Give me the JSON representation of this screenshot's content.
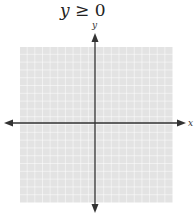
{
  "title": {
    "lhs": "y",
    "op": "≥",
    "rhs": "0"
  },
  "axes": {
    "x_label": "x",
    "y_label": "y"
  },
  "grid": {
    "cells_x": 20,
    "cells_y": 20,
    "fill": "#e3e3e3",
    "line": "#ffffff"
  },
  "colors": {
    "axis": "#333333"
  }
}
